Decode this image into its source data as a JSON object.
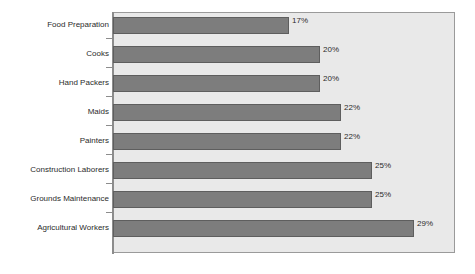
{
  "chart": {
    "type": "bar",
    "orientation": "horizontal",
    "background_color": "#ffffff",
    "plot_background_color": "#e9e9e9",
    "bar_color": "#7d7d7d",
    "bar_border_color": "#5e5e5e",
    "axis_color": "#8c8c8c"
  },
  "chart_data": {
    "type": "bar",
    "orientation": "horizontal",
    "title": "",
    "subtitle": "",
    "xlabel": "",
    "ylabel": "",
    "categories": [
      "Food Preparation",
      "Cooks",
      "Hand Packers",
      "Maids",
      "Painters",
      "Construction Laborers",
      "Grounds Maintenance",
      "Agricultural Workers"
    ],
    "values": [
      17,
      20,
      20,
      22,
      22,
      25,
      25,
      29
    ],
    "value_labels": [
      "17%",
      "20%",
      "20%",
      "22%",
      "22%",
      "25%",
      "25%",
      "29%"
    ],
    "unit": "%",
    "xlim": [
      0,
      33
    ],
    "grid": false,
    "legend": null,
    "tick_labels": [],
    "annotations": []
  }
}
